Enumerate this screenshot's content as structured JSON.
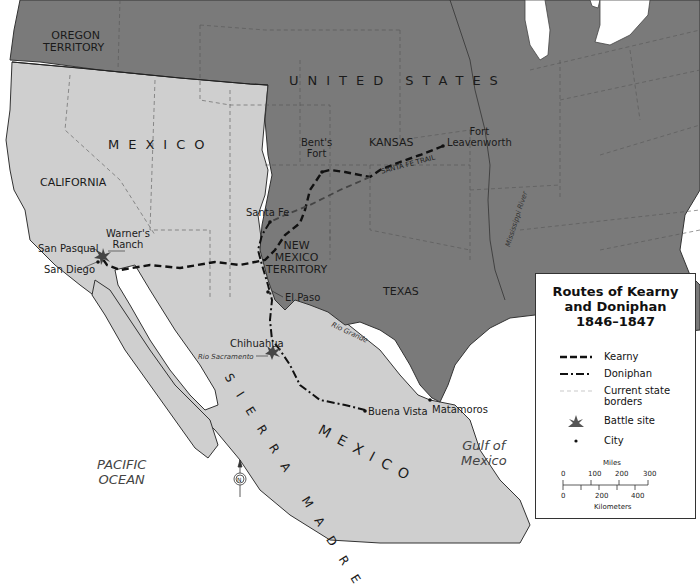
{
  "map": {
    "title": "Routes of Kearny and Doniphan 1846–1847",
    "colors": {
      "united_states": "#7a7a7a",
      "mexico": "#cfcfcf",
      "water": "#ffffff",
      "border_line": "#333333",
      "state_border": "#555555",
      "route": "#111111"
    },
    "regions": [
      {
        "name": "OREGON TERRITORY",
        "line1": "OREGON",
        "line2": "TERRITORY"
      },
      {
        "name": "UNITED STATES",
        "label": "UNITED STATES"
      },
      {
        "name": "MEXICO",
        "label": "MEXICO"
      },
      {
        "name": "CALIFORNIA",
        "label": "CALIFORNIA"
      },
      {
        "name": "KANSAS",
        "label": "KANSAS"
      },
      {
        "name": "NEW MEXICO TERRITORY",
        "line1": "NEW",
        "line2": "MEXICO",
        "line3": "TERRITORY"
      },
      {
        "name": "TEXAS",
        "label": "TEXAS"
      },
      {
        "name": "SIERRA MADRE",
        "label": "SIERRA MADRE"
      },
      {
        "name": "MEXICO (south)",
        "label": "MEXICO"
      }
    ],
    "water_bodies": [
      {
        "line1": "PACIFIC",
        "line2": "OCEAN"
      },
      {
        "line1": "Gulf of",
        "line2": "Mexico"
      }
    ],
    "rivers": [
      "Mississippi River",
      "Rio Grande",
      "Rio Sacramento"
    ],
    "trails": [
      "SANTA FE TRAIL"
    ],
    "places": [
      {
        "name": "Fort Leavenworth",
        "line1": "Fort",
        "line2": "Leavenworth"
      },
      {
        "name": "Bent's Fort",
        "line1": "Bent's",
        "line2": "Fort"
      },
      {
        "name": "Santa Fe"
      },
      {
        "name": "El Paso"
      },
      {
        "name": "Chihuahua"
      },
      {
        "name": "Buena Vista"
      },
      {
        "name": "Matamoros"
      },
      {
        "name": "Warner's Ranch",
        "line1": "Warner's",
        "line2": "Ranch"
      },
      {
        "name": "San Pasqual"
      },
      {
        "name": "San Diego"
      }
    ],
    "battle_sites": [
      "San Pasqual",
      "Chihuahua"
    ]
  },
  "legend": {
    "title_line1": "Routes of Kearny",
    "title_line2": "and Doniphan",
    "title_line3": "1846–1847",
    "items": [
      {
        "symbol": "dashed-line",
        "label": "Kearny"
      },
      {
        "symbol": "dash-dot-line",
        "label": "Doniphan"
      },
      {
        "symbol": "thin-dashed-line",
        "label_line1": "Current state",
        "label_line2": "borders"
      },
      {
        "symbol": "battle-star",
        "label": "Battle site"
      },
      {
        "symbol": "dot",
        "label": "City"
      }
    ],
    "scale": {
      "miles_label": "Miles",
      "miles_ticks": [
        "0",
        "100",
        "200",
        "300"
      ],
      "km_label": "Kilometers",
      "km_ticks": [
        "0",
        "200",
        "400"
      ]
    }
  },
  "compass": {
    "label": "N"
  }
}
